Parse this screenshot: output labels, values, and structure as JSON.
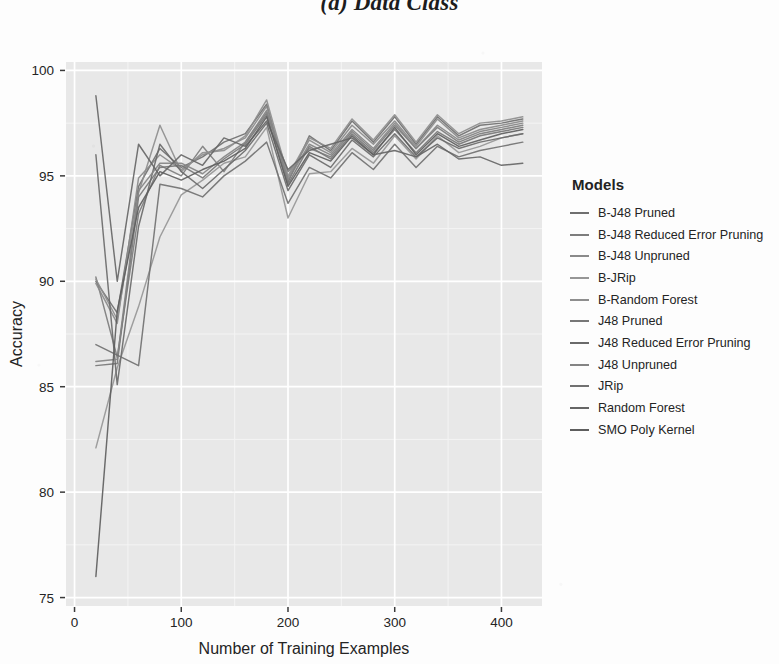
{
  "figure": {
    "title": "(a) Data Class"
  },
  "legend": {
    "title": "Models",
    "position": "right",
    "items": [
      {
        "label": "B-J48 Pruned",
        "color": "#6f6f6f"
      },
      {
        "label": "B-J48 Reduced Error Pruning",
        "color": "#7d7d7d"
      },
      {
        "label": "B-J48 Unpruned",
        "color": "#8a8a8a"
      },
      {
        "label": "B-JRip",
        "color": "#969696"
      },
      {
        "label": "B-Random Forest",
        "color": "#8e8e8e"
      },
      {
        "label": "J48 Pruned",
        "color": "#777777"
      },
      {
        "label": "J48 Reduced Error Pruning",
        "color": "#6a6a6a"
      },
      {
        "label": "J48 Unpruned",
        "color": "#848484"
      },
      {
        "label": "JRip",
        "color": "#717171"
      },
      {
        "label": "Random Forest",
        "color": "#666666"
      },
      {
        "label": "SMO Poly Kernel",
        "color": "#5e5e5e"
      }
    ]
  },
  "axes": {
    "x": {
      "label": "Number of Training Examples",
      "ticks": [
        0,
        100,
        200,
        300,
        400
      ],
      "tick_labels": [
        "0",
        "100",
        "200",
        "300",
        "400"
      ],
      "minor_ticks": [
        50,
        150,
        250,
        350
      ],
      "range": [
        -8,
        438
      ]
    },
    "y": {
      "label": "Accuracy",
      "ticks": [
        75,
        80,
        85,
        90,
        95,
        100
      ],
      "tick_labels": [
        "75",
        "80",
        "85",
        "90",
        "95",
        "100"
      ],
      "minor_ticks": [
        77.5,
        82.5,
        87.5,
        92.5,
        97.5
      ],
      "range": [
        74.6,
        100.4
      ]
    }
  },
  "style": {
    "panel_background": "#e8e8e8",
    "gridline_major": "#ffffff",
    "gridline_minor": "#f4f4f4",
    "text_color": "#242424",
    "page_background": "#fdfdfd"
  },
  "chart_data": {
    "type": "line",
    "title": "(a) Data Class",
    "xlabel": "Number of Training Examples",
    "ylabel": "Accuracy",
    "xlim": [
      -8,
      438
    ],
    "ylim": [
      74.6,
      100.4
    ],
    "grid": true,
    "legend_title": "Models",
    "legend_position": "right",
    "x": [
      20,
      40,
      60,
      80,
      100,
      120,
      140,
      160,
      180,
      200,
      220,
      240,
      260,
      280,
      300,
      320,
      340,
      360,
      380,
      400,
      420
    ],
    "series": [
      {
        "name": "B-J48 Pruned",
        "color": "#6f6f6f",
        "values": [
          90.0,
          88.5,
          94.5,
          96.3,
          95.4,
          95.9,
          96.6,
          97.0,
          98.4,
          94.7,
          96.9,
          96.2,
          97.6,
          96.6,
          97.8,
          96.5,
          97.8,
          96.9,
          97.4,
          97.5,
          97.7
        ]
      },
      {
        "name": "B-J48 Reduced Error Pruning",
        "color": "#7d7d7d",
        "values": [
          90.2,
          86.4,
          93.2,
          95.5,
          95.0,
          96.4,
          95.2,
          96.6,
          98.0,
          95.2,
          96.3,
          95.9,
          97.1,
          96.2,
          97.4,
          96.3,
          97.3,
          96.6,
          97.0,
          97.2,
          97.4
        ]
      },
      {
        "name": "B-J48 Unpruned",
        "color": "#8a8a8a",
        "values": [
          89.9,
          88.0,
          94.9,
          96.0,
          95.3,
          96.0,
          96.3,
          96.8,
          98.3,
          94.9,
          96.7,
          96.1,
          97.4,
          96.5,
          97.6,
          96.4,
          97.7,
          96.8,
          97.2,
          97.4,
          97.6
        ]
      },
      {
        "name": "B-JRip",
        "color": "#969696",
        "values": [
          82.1,
          85.9,
          88.8,
          92.1,
          94.1,
          94.8,
          95.6,
          95.9,
          97.3,
          93.0,
          95.1,
          95.2,
          96.3,
          95.6,
          96.9,
          95.8,
          96.9,
          96.1,
          96.4,
          96.8,
          97.0
        ]
      },
      {
        "name": "B-Random Forest",
        "color": "#8e8e8e",
        "values": [
          90.1,
          88.2,
          94.2,
          97.4,
          95.2,
          96.1,
          96.2,
          96.9,
          98.6,
          95.0,
          96.8,
          96.3,
          97.7,
          96.7,
          97.9,
          96.6,
          97.9,
          97.0,
          97.5,
          97.6,
          97.8
        ]
      },
      {
        "name": "J48 Pruned",
        "color": "#777777",
        "values": [
          86.0,
          86.1,
          94.0,
          95.4,
          95.5,
          94.9,
          95.8,
          96.5,
          97.9,
          94.6,
          96.4,
          95.8,
          97.0,
          96.1,
          97.2,
          96.1,
          97.1,
          96.5,
          96.9,
          97.1,
          97.3
        ]
      },
      {
        "name": "J48 Reduced Error Pruning",
        "color": "#6a6a6a",
        "values": [
          96.0,
          85.1,
          92.6,
          96.5,
          95.2,
          94.4,
          95.3,
          96.2,
          97.5,
          94.3,
          96.0,
          95.4,
          96.7,
          95.9,
          97.0,
          95.9,
          96.8,
          96.3,
          96.6,
          96.8,
          97.0
        ]
      },
      {
        "name": "J48 Unpruned",
        "color": "#848484",
        "values": [
          86.2,
          86.3,
          94.3,
          95.6,
          95.6,
          95.1,
          95.9,
          96.6,
          98.1,
          94.8,
          96.5,
          96.0,
          97.2,
          96.3,
          97.5,
          96.3,
          97.4,
          96.7,
          97.1,
          97.3,
          97.5
        ]
      },
      {
        "name": "JRip",
        "color": "#717171",
        "values": [
          87.0,
          86.5,
          86.0,
          94.6,
          94.4,
          94.0,
          95.0,
          95.7,
          96.6,
          93.7,
          95.4,
          94.9,
          96.1,
          95.3,
          96.5,
          95.4,
          96.4,
          95.9,
          96.2,
          96.4,
          96.6
        ]
      },
      {
        "name": "Random Forest",
        "color": "#666666",
        "values": [
          98.8,
          90.0,
          96.5,
          95.0,
          96.0,
          95.5,
          96.8,
          96.4,
          97.6,
          95.3,
          96.2,
          96.5,
          96.8,
          96.0,
          96.2,
          95.9,
          96.5,
          95.8,
          95.9,
          95.5,
          95.6
        ]
      },
      {
        "name": "SMO Poly Kernel",
        "color": "#5e5e5e",
        "values": [
          76.0,
          88.6,
          93.5,
          95.2,
          94.8,
          95.3,
          95.7,
          96.3,
          97.8,
          94.5,
          96.1,
          95.7,
          96.9,
          96.0,
          97.3,
          96.0,
          97.0,
          96.4,
          96.7,
          97.0,
          97.2
        ]
      }
    ]
  }
}
